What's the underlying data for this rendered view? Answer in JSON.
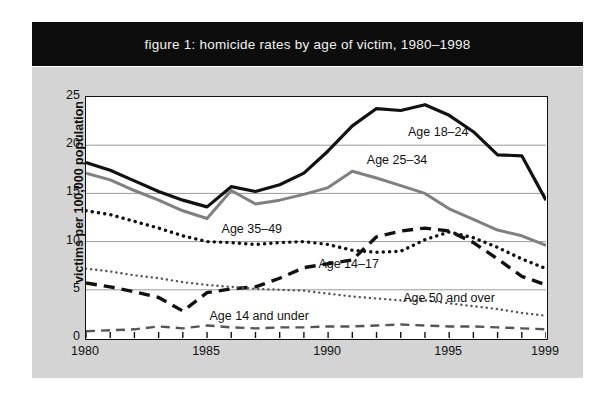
{
  "figure": {
    "title": "figure 1: homicide rates by age of victim, 1980–1998",
    "panel_color": "#d4d4d4",
    "title_band_color": "#0d0d0d",
    "plot_background": "#ffffff"
  },
  "chart_data": {
    "type": "line",
    "title": "figure 1: homicide rates by age of victim, 1980–1998",
    "xlabel": "",
    "ylabel": "victims per 100,000 population",
    "xlim": [
      1980,
      1999
    ],
    "ylim": [
      0,
      25
    ],
    "yticks": [
      0,
      5,
      10,
      15,
      20,
      25
    ],
    "xticks": [
      1980,
      1985,
      1990,
      1995,
      1999
    ],
    "xtick_labels": [
      "1980",
      "1985",
      "1990",
      "1995",
      "1999"
    ],
    "ytick_labels": [
      "0",
      "5",
      "10",
      "15",
      "20",
      "25"
    ],
    "grid": "horizontal",
    "legend": "inline-labels",
    "x": [
      1980,
      1981,
      1982,
      1983,
      1984,
      1985,
      1986,
      1987,
      1988,
      1989,
      1990,
      1991,
      1992,
      1993,
      1994,
      1995,
      1996,
      1997,
      1998,
      1999
    ],
    "series": [
      {
        "name": "Age 18–24",
        "label": "Age 18–24",
        "style": "solid",
        "color": "#111111",
        "width": 3.2,
        "label_x": 1993.3,
        "label_y": 21.3,
        "values": [
          18.2,
          17.4,
          16.3,
          15.2,
          14.3,
          13.6,
          15.7,
          15.2,
          15.9,
          17.1,
          19.4,
          22.0,
          23.8,
          23.6,
          24.2,
          23.1,
          21.4,
          19.0,
          18.9,
          14.3
        ]
      },
      {
        "name": "Age 25–34",
        "label": "Age 25–34",
        "style": "solid",
        "color": "#808080",
        "width": 3.0,
        "label_x": 1991.6,
        "label_y": 18.4,
        "values": [
          17.1,
          16.4,
          15.3,
          14.3,
          13.2,
          12.4,
          15.3,
          13.9,
          14.3,
          14.9,
          15.6,
          17.3,
          16.6,
          15.8,
          15.0,
          13.4,
          12.3,
          11.2,
          10.6,
          9.6
        ]
      },
      {
        "name": "Age 35–49",
        "label": "Age 35–49",
        "style": "dotted",
        "color": "#111111",
        "width": 3.4,
        "label_x": 1985.6,
        "label_y": 11.2,
        "values": [
          13.2,
          12.8,
          12.1,
          11.4,
          10.6,
          10.0,
          9.9,
          9.7,
          9.9,
          10.0,
          9.7,
          9.1,
          8.9,
          9.0,
          10.2,
          11.0,
          10.4,
          9.4,
          8.2,
          7.2
        ]
      },
      {
        "name": "Age 14–17",
        "label": "Age 14–17",
        "style": "dashed",
        "color": "#111111",
        "width": 3.4,
        "label_x": 1989.6,
        "label_y": 7.6,
        "values": [
          5.7,
          5.3,
          4.8,
          4.2,
          2.8,
          4.7,
          5.1,
          5.3,
          6.2,
          7.3,
          7.7,
          8.1,
          10.5,
          11.1,
          11.4,
          11.1,
          9.9,
          8.2,
          6.4,
          5.5
        ]
      },
      {
        "name": "Age 50 and over",
        "label": "Age 50 and over",
        "style": "fine-dotted",
        "color": "#555555",
        "width": 2.4,
        "label_x": 1993.1,
        "label_y": 4.0,
        "values": [
          7.2,
          6.9,
          6.5,
          6.2,
          5.8,
          5.5,
          5.3,
          5.1,
          5.0,
          4.9,
          4.6,
          4.3,
          4.1,
          3.9,
          3.9,
          3.6,
          3.3,
          3.0,
          2.6,
          2.3
        ]
      },
      {
        "name": "Age 14 and under",
        "label": "Age 14 and under",
        "style": "dashed-thin",
        "color": "#555555",
        "width": 2.4,
        "label_x": 1985.1,
        "label_y": 2.2,
        "values": [
          0.7,
          0.8,
          0.9,
          1.2,
          1.0,
          1.3,
          1.1,
          1.0,
          1.1,
          1.1,
          1.2,
          1.2,
          1.3,
          1.4,
          1.3,
          1.2,
          1.2,
          1.1,
          1.0,
          0.9
        ]
      }
    ]
  }
}
